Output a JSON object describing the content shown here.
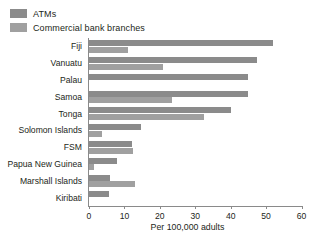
{
  "chart_data": {
    "type": "bar",
    "orientation": "horizontal",
    "title": "",
    "xlabel": "Per 100,000 adults",
    "ylabel": "",
    "xlim": [
      0,
      60
    ],
    "xticks": [
      0,
      10,
      20,
      30,
      40,
      50,
      60
    ],
    "grid": false,
    "legend_position": "top-left",
    "categories": [
      "Fiji",
      "Vanuatu",
      "Palau",
      "Samoa",
      "Tonga",
      "Solomon Islands",
      "FSM",
      "Papua New Guinea",
      "Marshall Islands",
      "Kiribati"
    ],
    "series": [
      {
        "name": "ATMs",
        "color": "#8b8b8b",
        "values": [
          52.0,
          47.5,
          45.0,
          45.0,
          40.0,
          14.7,
          12.2,
          8.0,
          5.8,
          5.6
        ]
      },
      {
        "name": "Commercial bank branches",
        "color": "#a0a0a0",
        "values": [
          11.0,
          21.0,
          0.0,
          23.5,
          32.5,
          3.8,
          12.4,
          1.4,
          13.0,
          0.0
        ]
      }
    ]
  },
  "legend": {
    "items": [
      {
        "label": "ATMs",
        "color": "#8b8b8b"
      },
      {
        "label": "Commercial bank branches",
        "color": "#a0a0a0"
      }
    ]
  },
  "axis": {
    "x_title": "Per 100,000 adults",
    "x_ticks": [
      "0",
      "10",
      "20",
      "30",
      "40",
      "50",
      "60"
    ]
  }
}
